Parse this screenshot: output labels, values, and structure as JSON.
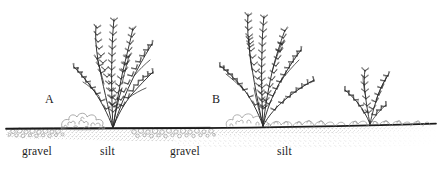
{
  "figure": {
    "type": "scientific-line-drawing",
    "background_color": "#ffffff",
    "ink_color": "#1b1b1b",
    "texture_color": "#8a8a8a",
    "panels": [
      {
        "id": "a",
        "label": "A"
      },
      {
        "id": "b",
        "label": "B"
      }
    ],
    "substrate_labels": [
      {
        "id": "gravel-left",
        "text": "gravel"
      },
      {
        "id": "silt-left",
        "text": "silt"
      },
      {
        "id": "gravel-right",
        "text": "gravel"
      },
      {
        "id": "silt-right",
        "text": "silt"
      }
    ]
  }
}
